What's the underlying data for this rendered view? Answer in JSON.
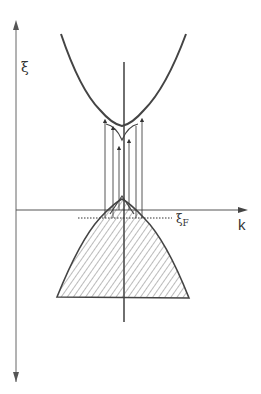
{
  "diagram": {
    "type": "band-structure",
    "y_axis_label": "ξ",
    "x_axis_label": "k",
    "fermi_label": "ξ",
    "fermi_subscript": "F",
    "colors": {
      "curve": "#444444",
      "axis": "#555555",
      "hatch": "#555555",
      "background": "#ffffff"
    },
    "elements": [
      "conduction band (upward parabola)",
      "valence band (downward parabola, hatched/filled)",
      "Fermi level (dotted line)",
      "vertical transition arrows",
      "vertical axis ξ",
      "horizontal axis k"
    ]
  }
}
